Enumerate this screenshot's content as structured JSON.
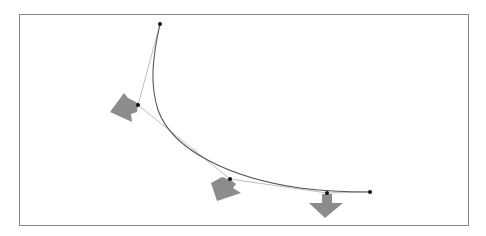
{
  "diagram": {
    "type": "bezier-curve-with-control-polygon",
    "frame": {
      "x": 19,
      "y": 14,
      "width": 450,
      "height": 212,
      "border_color": "#8a8a8a"
    },
    "curve": {
      "color": "#555555",
      "start": [
        160,
        24
      ],
      "end": [
        370,
        192
      ]
    },
    "control_polygon": {
      "color": "#bdbdbd",
      "points": [
        [
          160,
          24
        ],
        [
          138,
          105
        ],
        [
          230,
          179
        ],
        [
          327,
          193
        ],
        [
          370,
          192
        ]
      ]
    },
    "point_color": "#111111",
    "arrow_color": "#8c8c8c",
    "arrows": [
      {
        "name": "arrow-1",
        "at": [
          138,
          105
        ],
        "direction": "down-left"
      },
      {
        "name": "arrow-2",
        "at": [
          230,
          179
        ],
        "direction": "down-left"
      },
      {
        "name": "arrow-3",
        "at": [
          327,
          193
        ],
        "direction": "down"
      }
    ]
  }
}
